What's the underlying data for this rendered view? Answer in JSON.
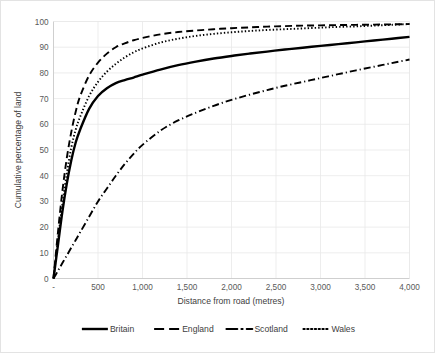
{
  "chart_data": {
    "type": "line",
    "title": "",
    "xlabel": "Distance from road (metres)",
    "ylabel": "Cumulative percentage of land",
    "xlim": [
      0,
      4000
    ],
    "ylim": [
      0,
      100
    ],
    "grid": true,
    "legend_position": "bottom",
    "x_tick_labels": [
      "-",
      "500",
      "1,000",
      "1,500",
      "2,000",
      "2,500",
      "3,000",
      "3,500",
      "4,000"
    ],
    "x_tick_values": [
      0,
      500,
      1000,
      1500,
      2000,
      2500,
      3000,
      3500,
      4000
    ],
    "y_tick_labels": [
      "0",
      "10",
      "20",
      "30",
      "40",
      "50",
      "60",
      "70",
      "80",
      "90",
      "100"
    ],
    "y_tick_values": [
      0,
      10,
      20,
      30,
      40,
      50,
      60,
      70,
      80,
      90,
      100
    ],
    "x": [
      0,
      50,
      100,
      150,
      200,
      250,
      300,
      400,
      500,
      600,
      700,
      800,
      900,
      1000,
      1200,
      1400,
      1600,
      1800,
      2000,
      2200,
      2400,
      2600,
      2800,
      3000,
      3200,
      3400,
      3600,
      3800,
      4000
    ],
    "series": [
      {
        "name": "Britain",
        "style": "solid",
        "color": "#000000",
        "values": [
          0,
          13,
          26,
          37,
          46,
          53,
          58,
          66,
          71,
          74,
          76,
          77.2,
          78.2,
          79.3,
          81.3,
          83.0,
          84.4,
          85.6,
          86.6,
          87.5,
          88.3,
          89.1,
          89.8,
          90.5,
          91.2,
          91.9,
          92.6,
          93.3,
          94.0
        ]
      },
      {
        "name": "England",
        "style": "dashed",
        "color": "#000000",
        "values": [
          0,
          18,
          34,
          47,
          57,
          65,
          71,
          79,
          84,
          87.5,
          90,
          91.5,
          92.7,
          93.6,
          95.0,
          95.9,
          96.5,
          97.0,
          97.4,
          97.7,
          98.0,
          98.2,
          98.4,
          98.5,
          98.6,
          98.7,
          98.8,
          98.9,
          99.0
        ]
      },
      {
        "name": "Scotland",
        "style": "dashdot",
        "color": "#000000",
        "values": [
          0,
          3,
          6,
          9,
          12,
          15,
          18,
          24,
          30,
          35,
          40,
          44.5,
          48.5,
          52,
          57.5,
          61.5,
          64.5,
          67.2,
          69.5,
          71.5,
          73.3,
          75.0,
          76.5,
          78.0,
          79.5,
          81.0,
          82.4,
          83.8,
          85.2
        ]
      },
      {
        "name": "Wales",
        "style": "dotted",
        "color": "#000000",
        "values": [
          0,
          15,
          29,
          41,
          51,
          58,
          63,
          71,
          76.5,
          80.5,
          83.5,
          86,
          88,
          89.5,
          91.8,
          93.3,
          94.4,
          95.2,
          95.8,
          96.3,
          96.7,
          97.0,
          97.3,
          97.6,
          97.9,
          98.1,
          98.4,
          98.7,
          99.0
        ]
      }
    ],
    "legend": [
      {
        "label": "Britain",
        "style": "solid"
      },
      {
        "label": "England",
        "style": "dashed"
      },
      {
        "label": "Scotland",
        "style": "dashdot"
      },
      {
        "label": "Wales",
        "style": "dotted"
      }
    ]
  }
}
